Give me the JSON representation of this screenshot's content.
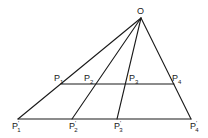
{
  "diagram": {
    "type": "projective-perspectivity",
    "apex": {
      "label": "O",
      "x": 141,
      "y": 18,
      "label_x": 137,
      "label_y": 14
    },
    "upper_line": {
      "y": 84,
      "x1": 61,
      "x2": 174,
      "points": [
        {
          "id": "P1",
          "base": "P",
          "sub": "1",
          "prime": "",
          "x": 61,
          "y": 84,
          "label_x": 54,
          "label_y": 81
        },
        {
          "id": "P2",
          "base": "P",
          "sub": "2",
          "prime": "",
          "x": 96,
          "y": 84,
          "label_x": 84,
          "label_y": 81
        },
        {
          "id": "P3",
          "base": "P",
          "sub": "3",
          "prime": "",
          "x": 125,
          "y": 84,
          "label_x": 129,
          "label_y": 81
        },
        {
          "id": "P4",
          "base": "P",
          "sub": "4",
          "prime": "",
          "x": 174,
          "y": 84,
          "label_x": 172,
          "label_y": 81
        }
      ]
    },
    "lower_line": {
      "y": 119,
      "x1": 18,
      "x2": 191,
      "points": [
        {
          "id": "P1'",
          "base": "P",
          "sub": "1",
          "prime": "'",
          "x": 18,
          "y": 119,
          "label_x": 12,
          "label_y": 129
        },
        {
          "id": "P2'",
          "base": "P",
          "sub": "2",
          "prime": "'",
          "x": 72,
          "y": 119,
          "label_x": 69,
          "label_y": 129
        },
        {
          "id": "P3'",
          "base": "P",
          "sub": "3",
          "prime": "'",
          "x": 117,
          "y": 119,
          "label_x": 114,
          "label_y": 129
        },
        {
          "id": "P4'",
          "base": "P",
          "sub": "4",
          "prime": "'",
          "x": 191,
          "y": 119,
          "label_x": 190,
          "label_y": 129
        }
      ]
    },
    "colors": {
      "stroke": "#1a1a1a",
      "background": "#ffffff"
    }
  }
}
